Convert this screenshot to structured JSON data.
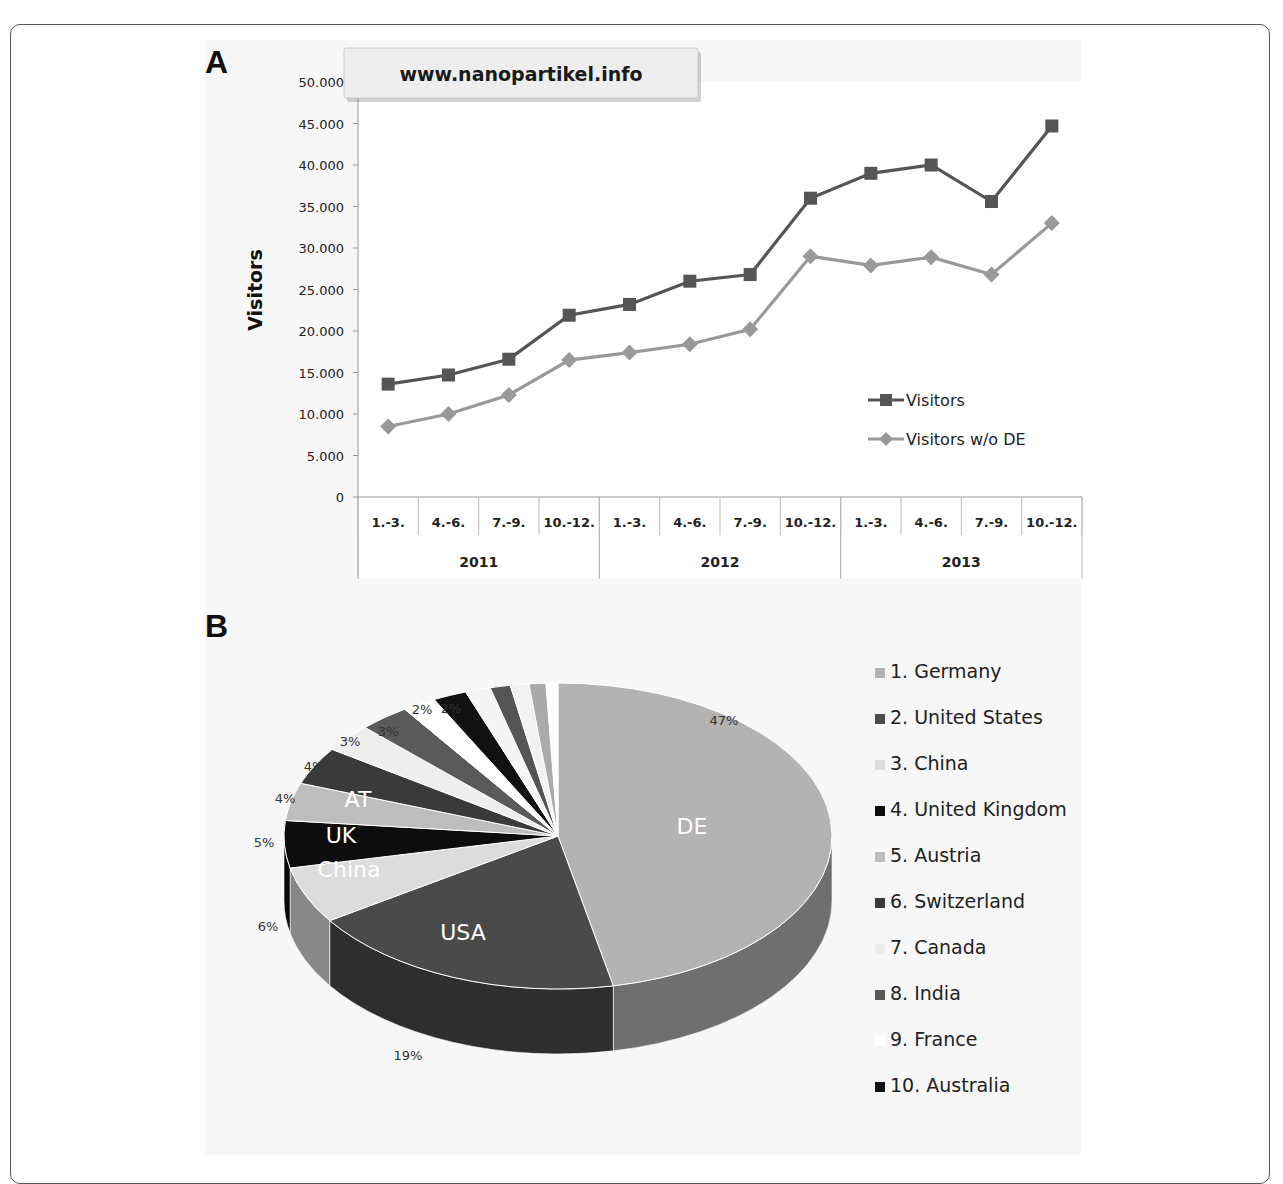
{
  "figure": {
    "panel_a_label": "A",
    "panel_b_label": "B"
  },
  "chart_data": [
    {
      "type": "line",
      "title": "www.nanopartikel.info",
      "xlabel": "",
      "ylabel": "Visitors",
      "ylim": [
        0,
        50000
      ],
      "y_ticks": [
        "0",
        "5.000",
        "10.000",
        "15.000",
        "20.000",
        "25.000",
        "30.000",
        "35.000",
        "40.000",
        "45.000",
        "50.000"
      ],
      "categories": [
        "1.-3.",
        "4.-6.",
        "7.-9.",
        "10.-12.",
        "1.-3.",
        "4.-6.",
        "7.-9.",
        "10.-12.",
        "1.-3.",
        "4.-6.",
        "7.-9.",
        "10.-12."
      ],
      "category_groups": [
        {
          "label": "2011",
          "span": 4
        },
        {
          "label": "2012",
          "span": 4
        },
        {
          "label": "2013",
          "span": 4
        }
      ],
      "series": [
        {
          "name": "Visitors",
          "marker": "square",
          "color": "#555555",
          "values": [
            13600,
            14700,
            16600,
            21900,
            23200,
            26000,
            26800,
            36000,
            39000,
            40000,
            35600,
            44700
          ]
        },
        {
          "name": "Visitors w/o DE",
          "marker": "diamond",
          "color": "#999999",
          "values": [
            8500,
            10000,
            12300,
            16500,
            17400,
            18400,
            20200,
            29000,
            27900,
            28900,
            26800,
            33000
          ]
        }
      ],
      "legend_position": "right-inside",
      "grid": false
    },
    {
      "type": "pie",
      "title": "",
      "slices": [
        {
          "label": "DE",
          "legend": "1. Germany",
          "value": 47,
          "pct_label": "47%",
          "color": "#b3b3b3",
          "in_label": "DE"
        },
        {
          "label": "USA",
          "legend": "2. United States",
          "value": 19,
          "pct_label": "19%",
          "color": "#4a4a4a",
          "in_label": "USA"
        },
        {
          "label": "China",
          "legend": "3. China",
          "value": 6,
          "pct_label": "6%",
          "color": "#dcdcdc",
          "in_label": "China"
        },
        {
          "label": "UK",
          "legend": "4. United Kingdom",
          "value": 5,
          "pct_label": "5%",
          "color": "#0d0d0d",
          "in_label": "UK"
        },
        {
          "label": "AT",
          "legend": "5. Austria",
          "value": 4,
          "pct_label": "4%",
          "color": "#bdbdbd",
          "in_label": "AT"
        },
        {
          "label": "CH",
          "legend": "6. Switzerland",
          "value": 4,
          "pct_label": "4%",
          "color": "#3a3a3a",
          "in_label": ""
        },
        {
          "label": "CA",
          "legend": "7. Canada",
          "value": 3,
          "pct_label": "3%",
          "color": "#eeeeee",
          "in_label": ""
        },
        {
          "label": "IN",
          "legend": "8. India",
          "value": 3,
          "pct_label": "3%",
          "color": "#5a5a5a",
          "in_label": ""
        },
        {
          "label": "FR",
          "legend": "9. France",
          "value": 2,
          "pct_label": "2%",
          "color": "#ffffff",
          "in_label": ""
        },
        {
          "label": "AU",
          "legend": "10. Australia",
          "value": 2,
          "pct_label": "2%",
          "color": "#111111",
          "in_label": ""
        },
        {
          "label": "other1",
          "legend": "",
          "value": 1.5,
          "pct_label": "",
          "color": "#f5f5f5",
          "in_label": ""
        },
        {
          "label": "other2",
          "legend": "",
          "value": 1.2,
          "pct_label": "",
          "color": "#555555",
          "in_label": ""
        },
        {
          "label": "other3",
          "legend": "",
          "value": 1.1,
          "pct_label": "",
          "color": "#f2f2f2",
          "in_label": ""
        },
        {
          "label": "other4",
          "legend": "",
          "value": 1.0,
          "pct_label": "",
          "color": "#aaaaaa",
          "in_label": ""
        },
        {
          "label": "other5",
          "legend": "",
          "value": 0.7,
          "pct_label": "",
          "color": "#ffffff",
          "in_label": ""
        }
      ],
      "legend": [
        "1. Germany",
        "2. United States",
        "3. China",
        "4. United Kingdom",
        "5. Austria",
        "6. Switzerland",
        "7. Canada",
        "8. India",
        "9. France",
        "10. Australia"
      ],
      "legend_position": "right",
      "style": "3d"
    }
  ]
}
